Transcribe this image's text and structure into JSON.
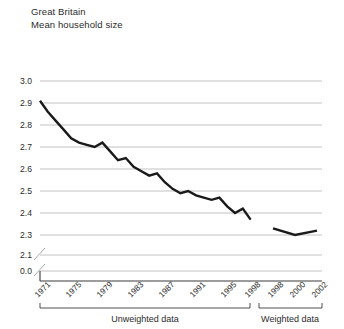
{
  "header": {
    "region": "Great Britain",
    "measure": "Mean household size"
  },
  "chart_data": {
    "type": "line",
    "title": "Great Britain",
    "subtitle": "Mean household size",
    "xlabel": "",
    "ylabel": "",
    "grid": true,
    "legend": false,
    "ylim": [
      2.25,
      3.0
    ],
    "y_ticks": [
      "3.0",
      "2.9",
      "2.8",
      "2.7",
      "2.6",
      "2.5",
      "2.4",
      "2.3",
      "2.1",
      "0.0"
    ],
    "y_axis_break": true,
    "x_tick_labels": [
      "1971",
      "1975",
      "1979",
      "1983",
      "1987",
      "1991",
      "1995",
      "1998",
      "1998",
      "2000",
      "2002"
    ],
    "annotations": [
      "Unweighted data",
      "Weighted data"
    ],
    "series": [
      {
        "name": "Unweighted data",
        "x": [
          1971,
          1972,
          1973,
          1974,
          1975,
          1976,
          1977,
          1978,
          1979,
          1980,
          1981,
          1982,
          1983,
          1984,
          1985,
          1986,
          1987,
          1988,
          1989,
          1990,
          1991,
          1992,
          1993,
          1994,
          1995,
          1996,
          1997,
          1998
        ],
        "values": [
          2.91,
          2.86,
          2.82,
          2.78,
          2.74,
          2.72,
          2.71,
          2.7,
          2.72,
          2.68,
          2.64,
          2.65,
          2.61,
          2.59,
          2.57,
          2.58,
          2.54,
          2.51,
          2.49,
          2.5,
          2.48,
          2.47,
          2.46,
          2.47,
          2.43,
          2.4,
          2.42,
          2.37
        ]
      },
      {
        "name": "Weighted data",
        "x": [
          1998,
          2000,
          2002
        ],
        "values": [
          2.33,
          2.3,
          2.32
        ]
      }
    ]
  },
  "groups": {
    "unweighted_label": "Unweighted data",
    "weighted_label": "Weighted data"
  },
  "colors": {
    "line": "#1a1a1a",
    "grid": "#b3b3b3",
    "axis": "#3a3a3a",
    "background": "#ffffff",
    "text": "#2b2b2b"
  }
}
